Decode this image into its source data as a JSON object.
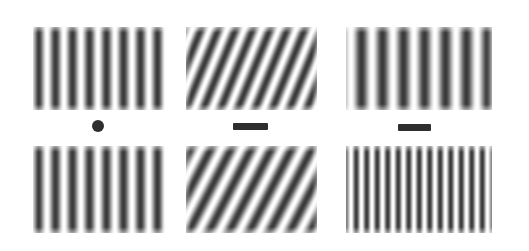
{
  "figure": {
    "width_px": 529,
    "height_px": 251,
    "background_color": "#ffffff",
    "grating_dark_color": "#3a3a3a",
    "grating_light_color": "#ffffff",
    "marker_color": "#2e2e2e"
  },
  "panels": [
    {
      "id": "panel-top-left",
      "row": "top",
      "column": "left",
      "orientation_label": "vertical",
      "orientation_deg": 0,
      "bar_count": 8,
      "period_px": 17,
      "spatial_frequency_label": "medium",
      "x": 33,
      "y": 27,
      "w": 134,
      "h": 83
    },
    {
      "id": "panel-top-middle",
      "row": "top",
      "column": "middle",
      "orientation_label": "oblique-right",
      "orientation_deg": 22,
      "bar_count": 9,
      "period_px": 16,
      "spatial_frequency_label": "medium",
      "x": 186,
      "y": 27,
      "w": 131,
      "h": 83
    },
    {
      "id": "panel-top-right",
      "row": "top",
      "column": "right",
      "orientation_label": "vertical",
      "orientation_deg": 0,
      "bar_count": 7,
      "period_px": 21,
      "spatial_frequency_label": "low",
      "x": 346,
      "y": 27,
      "w": 146,
      "h": 83
    },
    {
      "id": "panel-bottom-left",
      "row": "bottom",
      "column": "left",
      "orientation_label": "vertical",
      "orientation_deg": 0,
      "bar_count": 8,
      "period_px": 17,
      "spatial_frequency_label": "medium",
      "x": 33,
      "y": 146,
      "w": 134,
      "h": 87
    },
    {
      "id": "panel-bottom-middle",
      "row": "bottom",
      "column": "middle",
      "orientation_label": "oblique-right",
      "orientation_deg": 27,
      "bar_count": 8,
      "period_px": 18,
      "spatial_frequency_label": "medium-low",
      "x": 186,
      "y": 146,
      "w": 131,
      "h": 87
    },
    {
      "id": "panel-bottom-right",
      "row": "bottom",
      "column": "right",
      "orientation_label": "vertical",
      "orientation_deg": 0,
      "bar_count": 14,
      "period_px": 10.5,
      "spatial_frequency_label": "high",
      "x": 346,
      "y": 146,
      "w": 146,
      "h": 87
    }
  ],
  "markers": [
    {
      "id": "marker-left",
      "shape": "dot",
      "glyph": "circle",
      "x": 92,
      "y": 120,
      "w": 12,
      "h": 12
    },
    {
      "id": "marker-middle",
      "shape": "dash",
      "glyph": "horizontal-bar",
      "x": 233,
      "y": 123,
      "w": 35,
      "h": 7
    },
    {
      "id": "marker-right",
      "shape": "dash",
      "glyph": "horizontal-bar",
      "x": 398,
      "y": 124,
      "w": 33,
      "h": 7
    }
  ]
}
